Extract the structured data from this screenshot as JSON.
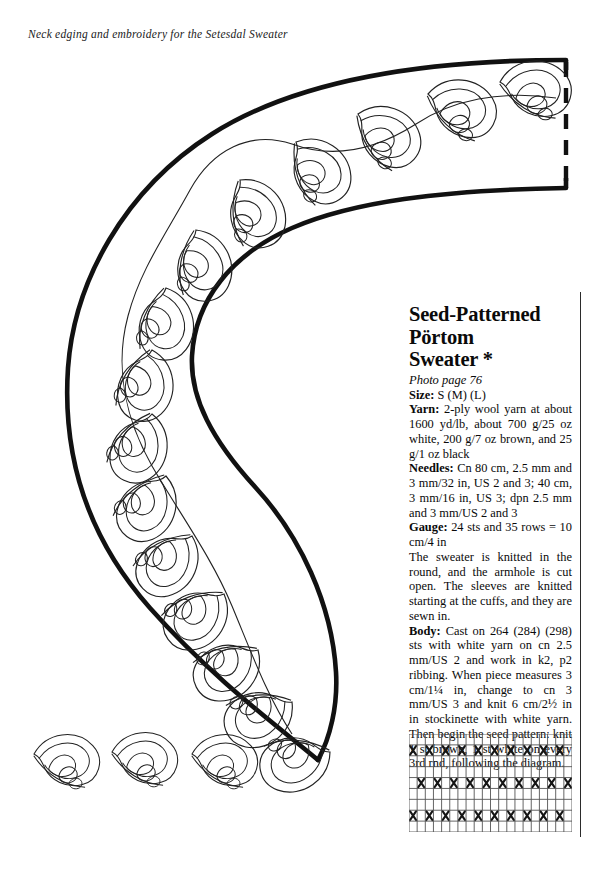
{
  "page": {
    "caption": "Neck edging and embroidery for the Setesdal Sweater"
  },
  "diagram": {
    "name": "neck-edging-crescent-with-scroll-embroidery",
    "outline_color": "#111111",
    "motif_line_color": "#222222",
    "fold_line_style": "dashed",
    "detached_motif_count": 3
  },
  "recipe": {
    "title_lines": [
      "Seed-Patterned",
      "Pörtom",
      "Sweater *"
    ],
    "photo_reference": "Photo page 76",
    "specs": [
      {
        "label": "Size:",
        "value": "S (M) (L)"
      },
      {
        "label": "Yarn:",
        "value": "2-ply wool yarn at about 1600 yd/lb, about 700 g/25 oz white, 200 g/7 oz brown, and 25 g/1 oz black"
      },
      {
        "label": "Needles:",
        "value": "Cn 80 cm, 2.5 mm and 3 mm/32 in, US 2 and 3; 40 cm, 3 mm/16 in, US 3; dpn 2.5 mm and 3 mm/US 2 and 3"
      },
      {
        "label": "Gauge:",
        "value": "24 sts and 35 rows = 10 cm/4 in"
      }
    ],
    "intro_paragraph": "The sweater is knitted in the round, and the armhole is cut open. The sleeves are knitted starting at the cuffs, and they are sewn in.",
    "body_label": "Body:",
    "body_paragraph": "Cast on 264 (284) (298) sts with white yarn on cn 2.5 mm/US 2 and work in k2, p2 ribbing. When piece measures 3 cm/1¼ in, change to cn 3 mm/US 3 and knit 6 cm/2½ in in stockinette with white yarn. Then begin the seed pattern: knit 1 st brown, 1 st white on every 3rd rnd, following the diagram."
  },
  "chart_data": {
    "type": "heatmap",
    "title": "",
    "columns": 20,
    "rows": 9,
    "cell_symbols": {
      "marked": "X",
      "blank": ""
    },
    "marked_color": "#151515",
    "grid_color": "#555555",
    "xlabel": "stitches",
    "ylabel": "rounds",
    "grid": [
      [
        0,
        0,
        0,
        0,
        0,
        0,
        0,
        0,
        0,
        0,
        0,
        0,
        0,
        0,
        0,
        0,
        0,
        0,
        0,
        0
      ],
      [
        1,
        0,
        1,
        0,
        1,
        0,
        1,
        0,
        1,
        0,
        1,
        0,
        1,
        0,
        1,
        0,
        1,
        0,
        1,
        0
      ],
      [
        0,
        0,
        0,
        0,
        0,
        0,
        0,
        0,
        0,
        0,
        0,
        0,
        0,
        0,
        0,
        0,
        0,
        0,
        0,
        0
      ],
      [
        0,
        0,
        0,
        0,
        0,
        0,
        0,
        0,
        0,
        0,
        0,
        0,
        0,
        0,
        0,
        0,
        0,
        0,
        0,
        0
      ],
      [
        0,
        1,
        0,
        1,
        0,
        1,
        0,
        1,
        0,
        1,
        0,
        1,
        0,
        1,
        0,
        1,
        0,
        1,
        0,
        1
      ],
      [
        0,
        0,
        0,
        0,
        0,
        0,
        0,
        0,
        0,
        0,
        0,
        0,
        0,
        0,
        0,
        0,
        0,
        0,
        0,
        0
      ],
      [
        0,
        0,
        0,
        0,
        0,
        0,
        0,
        0,
        0,
        0,
        0,
        0,
        0,
        0,
        0,
        0,
        0,
        0,
        0,
        0
      ],
      [
        1,
        0,
        1,
        0,
        1,
        0,
        1,
        0,
        1,
        0,
        1,
        0,
        1,
        0,
        1,
        0,
        1,
        0,
        1,
        0
      ],
      [
        0,
        0,
        0,
        0,
        0,
        0,
        0,
        0,
        0,
        0,
        0,
        0,
        0,
        0,
        0,
        0,
        0,
        0,
        0,
        0
      ]
    ]
  }
}
